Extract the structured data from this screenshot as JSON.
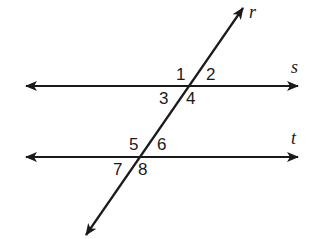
{
  "diagram": {
    "lines": {
      "s": {
        "label": "s",
        "y": 86
      },
      "t": {
        "label": "t",
        "y": 157
      },
      "r": {
        "label": "r"
      }
    },
    "angles": {
      "a1": "1",
      "a2": "2",
      "a3": "3",
      "a4": "4",
      "a5": "5",
      "a6": "6",
      "a7": "7",
      "a8": "8"
    },
    "colors": {
      "stroke": "#1a1a1a",
      "background": "#ffffff"
    }
  }
}
